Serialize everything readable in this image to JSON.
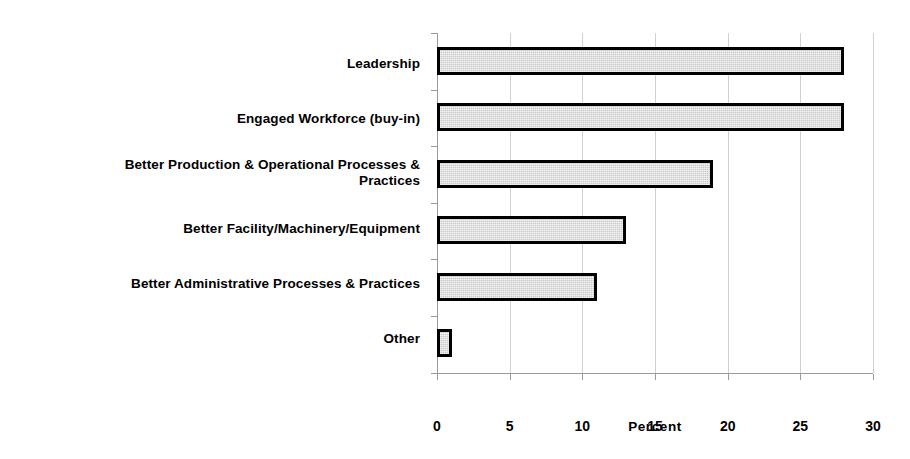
{
  "chart_data": {
    "type": "bar",
    "orientation": "horizontal",
    "title": "",
    "xlabel": "Percent",
    "ylabel": "",
    "xlim": [
      0,
      30
    ],
    "xticks": [
      0,
      5,
      10,
      15,
      20,
      25,
      30
    ],
    "xtick_labels": [
      "0",
      "5",
      "10",
      "15",
      "20",
      "25",
      "30"
    ],
    "grid": true,
    "grid_axis": "x",
    "legend": false,
    "categories": [
      "Leadership",
      "Engaged Workforce (buy-in)",
      "Better Production & Operational Processes & Practices",
      "Better Facility/Machinery/Equipment",
      "Better Administrative Processes & Practices",
      "Other"
    ],
    "category_lines": [
      [
        "Leadership"
      ],
      [
        "Engaged Workforce (buy-in)"
      ],
      [
        "Better Production & Operational Processes &",
        "Practices"
      ],
      [
        "Better Facility/Machinery/Equipment"
      ],
      [
        "Better Administrative Processes & Practices"
      ],
      [
        "Other"
      ]
    ],
    "values": [
      28,
      28,
      19,
      13,
      11,
      1
    ],
    "bar_fill_color": "#c9c9c9",
    "bar_edge_color": "#000000",
    "gridline_color": "#d0d0d0",
    "axis_color": "#9a9a9a",
    "background_color": "#ffffff"
  },
  "axis": {
    "x_title": "Percent"
  }
}
